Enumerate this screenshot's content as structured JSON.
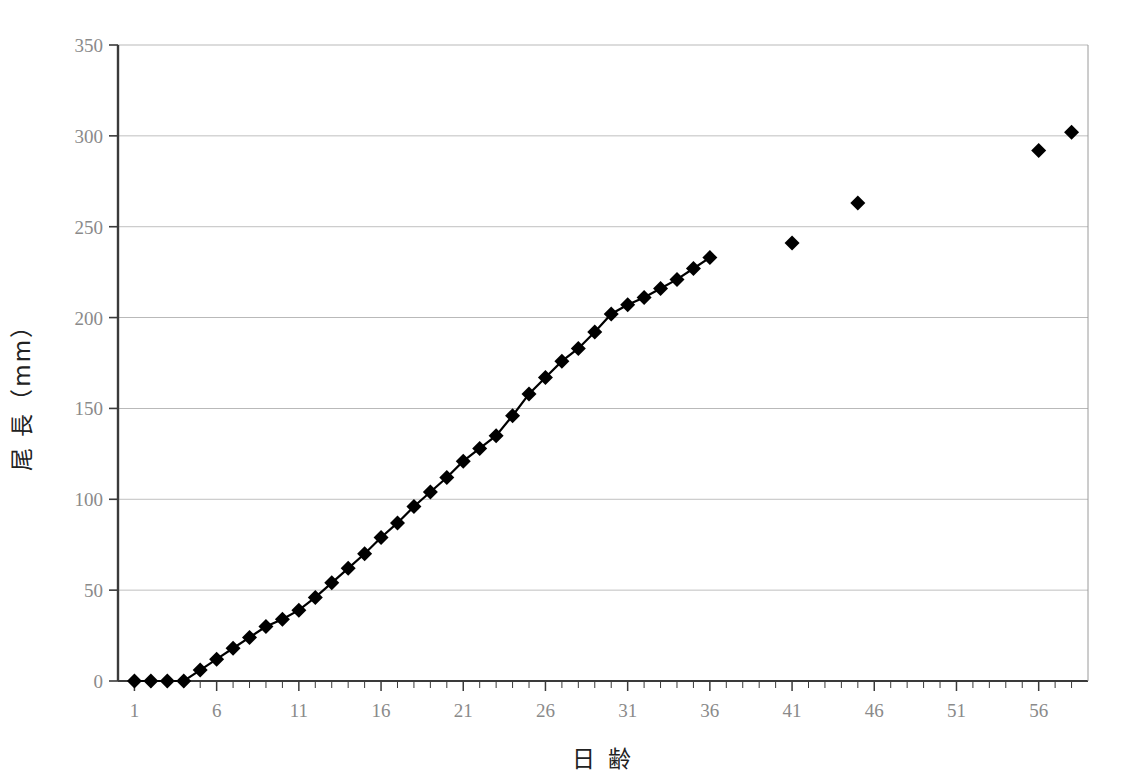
{
  "chart_data": {
    "type": "line",
    "title": "",
    "subtitle": "",
    "xlabel": "日  齢",
    "ylabel": "尾  長（mm）",
    "xlim": [
      0,
      59
    ],
    "ylim": [
      0,
      350
    ],
    "ytick_values": [
      0,
      50,
      100,
      150,
      200,
      250,
      300,
      350
    ],
    "ytick_labels": [
      "0",
      "50",
      "100",
      "150",
      "200",
      "250",
      "300",
      "350"
    ],
    "xtick_labels": [
      "1",
      "6",
      "11",
      "16",
      "21",
      "26",
      "31",
      "36",
      "41",
      "46",
      "51",
      "56"
    ],
    "xtick_values": [
      1,
      6,
      11,
      16,
      21,
      26,
      31,
      36,
      41,
      46,
      51,
      56
    ],
    "xtick_minor_step": 1,
    "grid": "horizontal",
    "legend": "none",
    "marker": "filled-diamond",
    "marker_color": "#000000",
    "line_color": "#000000",
    "grid_color": "#b9b9b9",
    "axis_color": "#3a3a3a",
    "series": [
      {
        "name": "連続測定（日齢1-36）",
        "connected": true,
        "x": [
          1,
          2,
          3,
          4,
          5,
          6,
          7,
          8,
          9,
          10,
          11,
          12,
          13,
          14,
          15,
          16,
          17,
          18,
          19,
          20,
          21,
          22,
          23,
          24,
          25,
          26,
          27,
          28,
          29,
          30,
          31,
          32,
          33,
          34,
          35,
          36
        ],
        "values": [
          0,
          0,
          0,
          0,
          6,
          12,
          18,
          24,
          30,
          34,
          39,
          46,
          54,
          62,
          70,
          79,
          87,
          96,
          104,
          112,
          121,
          128,
          135,
          146,
          158,
          167,
          176,
          183,
          192,
          202,
          207,
          211,
          216,
          221,
          227,
          233
        ]
      },
      {
        "name": "断続測定（日齢41以降）",
        "connected": false,
        "x": [
          41,
          45,
          56,
          58
        ],
        "values": [
          241,
          263,
          292,
          302
        ]
      }
    ]
  }
}
